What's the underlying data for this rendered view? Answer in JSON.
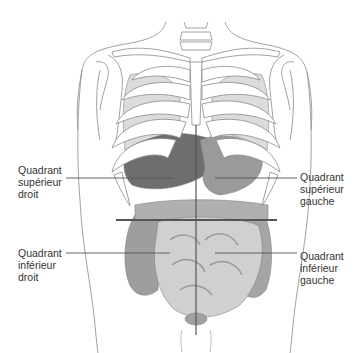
{
  "diagram": {
    "colors": {
      "outline": "#8a8a8a",
      "bone_fill": "#ffffff",
      "organ_dark": "#6e6e6e",
      "organ_mid": "#9a9a9a",
      "organ_light": "#c9c9c9",
      "quadrant_line": "#555555"
    },
    "labels": {
      "upper_right": [
        "Quadrant",
        "supérieur",
        "droit"
      ],
      "upper_left": [
        "Quadrant",
        "supérieur",
        "gauche"
      ],
      "lower_right": [
        "Quadrant",
        "inférieur",
        "droit"
      ],
      "lower_left": [
        "Quadrant",
        "inférieur",
        "gauche"
      ]
    }
  }
}
